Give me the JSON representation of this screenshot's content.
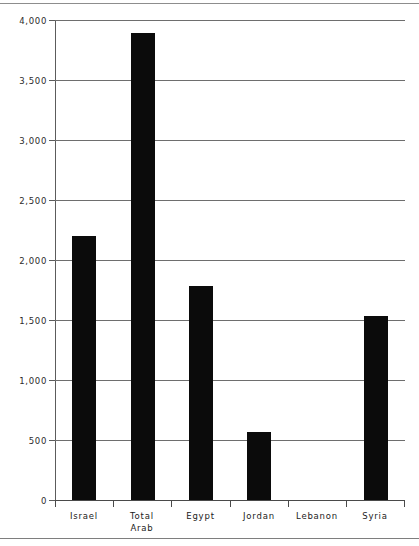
{
  "chart_data": {
    "type": "bar",
    "title": "",
    "subtitle": "",
    "xlabel": "",
    "ylabel": "",
    "ylim": [
      0,
      4000
    ],
    "grid": true,
    "legend": "none",
    "orientation": "vertical",
    "bar_color": "#0b0b0b",
    "categories": [
      "Israel",
      "Total\nArab",
      "Egypt",
      "Jordan",
      "Lebanon",
      "Syria"
    ],
    "values": [
      2200,
      3890,
      1780,
      570,
      0,
      1530
    ],
    "y_ticks": [
      0,
      500,
      1000,
      1500,
      2000,
      2500,
      3000,
      3500,
      4000
    ],
    "y_tick_labels": [
      "0",
      "500",
      "1,000",
      "1,500",
      "2,000",
      "2,500",
      "3,000",
      "3,500",
      "4,000"
    ],
    "points": [
      {
        "category": "Israel",
        "label": "Israel",
        "value": 2200
      },
      {
        "category": "Total Arab",
        "label": "Total\nArab",
        "value": 3890
      },
      {
        "category": "Egypt",
        "label": "Egypt",
        "value": 1780
      },
      {
        "category": "Jordan",
        "label": "Jordan",
        "value": 570
      },
      {
        "category": "Lebanon",
        "label": "Lebanon",
        "value": 0
      },
      {
        "category": "Syria",
        "label": "Syria",
        "value": 1530
      }
    ]
  },
  "colors": {
    "bar": "#0b0b0b",
    "gridline": "#6e6e6e",
    "axis": "#4a4a4a",
    "text": "#222222",
    "background": "#ffffff"
  }
}
